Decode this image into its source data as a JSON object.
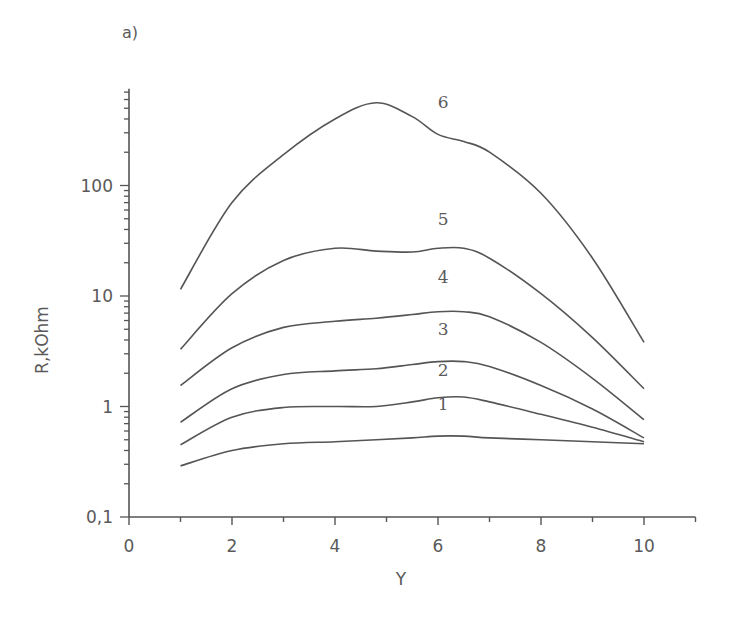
{
  "panel_label": "a)",
  "chart_data": {
    "type": "line",
    "title": "",
    "panel": "a)",
    "xlabel": "Y",
    "ylabel": "R,kOhm",
    "xscale": "linear",
    "yscale": "log",
    "xlim": [
      0,
      11
    ],
    "ylim": [
      0.1,
      750
    ],
    "grid": false,
    "legend": "inline curve labels",
    "x_ticks": [
      0,
      2,
      4,
      6,
      8,
      10
    ],
    "x_tick_labels": [
      "0",
      "2",
      "4",
      "6",
      "8",
      "10"
    ],
    "y_ticks": [
      0.1,
      1,
      10,
      100
    ],
    "y_tick_labels": [
      "0,1",
      "1",
      "10",
      "100"
    ],
    "x": [
      1,
      2,
      3,
      4,
      4.8,
      5.5,
      6,
      6.5,
      7,
      8,
      9,
      10
    ],
    "series": [
      {
        "name": "1",
        "values": [
          0.29,
          0.4,
          0.46,
          0.48,
          0.5,
          0.52,
          0.54,
          0.54,
          0.52,
          0.5,
          0.48,
          0.46
        ]
      },
      {
        "name": "2",
        "values": [
          0.45,
          0.8,
          0.98,
          1.0,
          1.0,
          1.1,
          1.2,
          1.22,
          1.1,
          0.85,
          0.65,
          0.48
        ]
      },
      {
        "name": "3",
        "values": [
          0.72,
          1.45,
          1.95,
          2.1,
          2.2,
          2.4,
          2.55,
          2.55,
          2.3,
          1.55,
          0.95,
          0.52
        ]
      },
      {
        "name": "4",
        "values": [
          1.55,
          3.4,
          5.2,
          5.9,
          6.3,
          6.8,
          7.2,
          7.2,
          6.5,
          3.8,
          1.8,
          0.76
        ]
      },
      {
        "name": "5",
        "values": [
          3.3,
          10.5,
          21.0,
          27.0,
          25.5,
          25.0,
          27.0,
          27.0,
          22.0,
          10.5,
          4.2,
          1.45
        ]
      },
      {
        "name": "6",
        "values": [
          11.5,
          70.0,
          190.0,
          400.0,
          560.0,
          420.0,
          290.0,
          250.0,
          200.0,
          85.0,
          22.0,
          3.8
        ]
      }
    ],
    "curve_label_positions": [
      {
        "name": "1",
        "x": 6.1,
        "y": 0.93
      },
      {
        "name": "2",
        "x": 6.1,
        "y": 1.9
      },
      {
        "name": "3",
        "x": 6.1,
        "y": 4.4
      },
      {
        "name": "4",
        "x": 6.1,
        "y": 13.0
      },
      {
        "name": "5",
        "x": 6.1,
        "y": 44.0
      },
      {
        "name": "6",
        "x": 6.1,
        "y": 500.0
      }
    ]
  },
  "colors": {
    "line": "#555555",
    "axis": "#555555",
    "text": "#5a5a5a",
    "background": "#ffffff"
  }
}
